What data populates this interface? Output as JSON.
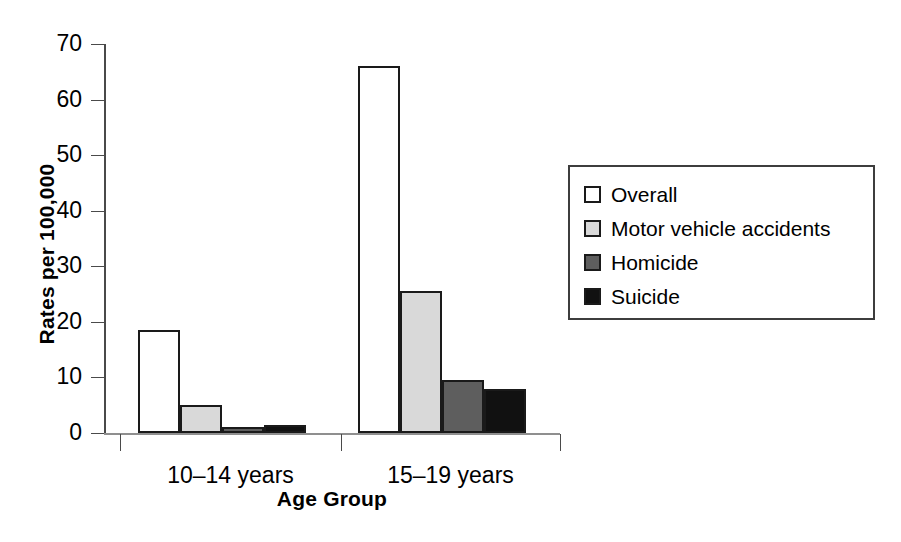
{
  "chart_data": {
    "type": "bar",
    "title": "",
    "subtitle": "",
    "xlabel": "Age Group",
    "ylabel": "Rates per 100,000",
    "categories": [
      "10–14 years",
      "15–19 years"
    ],
    "series": [
      {
        "name": "Overall",
        "values": [
          18.5,
          66.0
        ],
        "color": "#ffffff"
      },
      {
        "name": "Motor vehicle accidents",
        "values": [
          5.0,
          25.5
        ],
        "color": "#d9d9d9"
      },
      {
        "name": "Homicide",
        "values": [
          1.0,
          9.5
        ],
        "color": "#5e5e5e"
      },
      {
        "name": "Suicide",
        "values": [
          1.5,
          8.0
        ],
        "color": "#111111"
      }
    ],
    "ylim": [
      0,
      70
    ],
    "yticks": [
      0,
      10,
      20,
      30,
      40,
      50,
      60,
      70
    ],
    "ytick_labels": [
      "0",
      "10",
      "20",
      "30",
      "40",
      "50",
      "60",
      "70"
    ],
    "grid": false,
    "legend_position": "right"
  },
  "axes": {
    "y_title": "Rates per 100,000",
    "x_title": "Age Group",
    "y_tick_labels": [
      "70",
      "60",
      "50",
      "40",
      "30",
      "20",
      "10",
      "0"
    ],
    "x_tick_labels": [
      "10–14 years",
      "15–19 years"
    ]
  },
  "legend": {
    "items": [
      {
        "label": "Overall",
        "swatch": "legend-swatch-overall"
      },
      {
        "label": "Motor vehicle accidents",
        "swatch": "legend-swatch-motor-vehicle-accidents"
      },
      {
        "label": "Homicide",
        "swatch": "legend-swatch-homicide"
      },
      {
        "label": "Suicide",
        "swatch": "legend-swatch-suicide"
      }
    ]
  },
  "colors": {
    "overall": "#ffffff",
    "motor_vehicle_accidents": "#d9d9d9",
    "homicide": "#5e5e5e",
    "suicide": "#111111",
    "outline": "#1a1a1a",
    "axis": "#4a4a4a",
    "background": "#ffffff"
  }
}
